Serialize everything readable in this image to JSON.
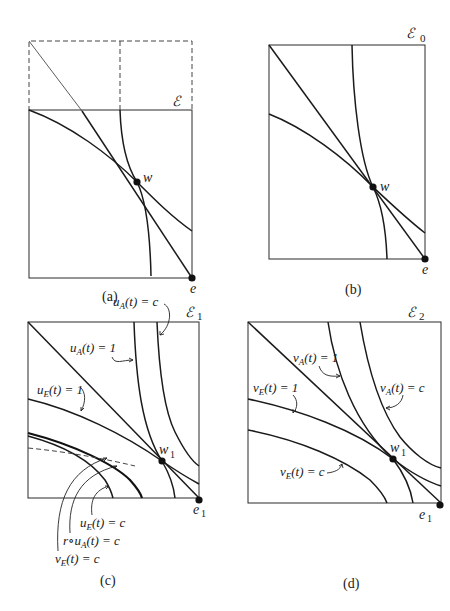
{
  "header": {
    "partial_text": ""
  },
  "panels": {
    "a": {
      "caption": "(a)",
      "set_label": "ℰ",
      "point_w": "w",
      "point_e": "e"
    },
    "b": {
      "caption": "(b)",
      "set_label": "ℰ",
      "set_sub": "0",
      "point_w": "w",
      "point_e": "e"
    },
    "c": {
      "caption": "(c)",
      "set_label": "ℰ",
      "set_sub": "1",
      "point_w": "w",
      "point_w_sub": "1",
      "point_e": "e",
      "point_e_sub": "1",
      "labels": {
        "uA_c": {
          "fn": "u",
          "sub": "A",
          "arg": "(t) = c"
        },
        "uA_1": {
          "fn": "u",
          "sub": "A",
          "arg": "(t) = 1"
        },
        "uE_1": {
          "fn": "u",
          "sub": "E",
          "arg": "(t) = 1"
        },
        "uE_c": {
          "fn": "u",
          "sub": "E",
          "arg": "(t) = c"
        },
        "r_uA_c": {
          "prefix": "r∘",
          "fn": "u",
          "sub": "A",
          "arg": "(t) = c"
        },
        "vE_c": {
          "fn": "v",
          "sub": "E",
          "arg": "(t) = c"
        }
      }
    },
    "d": {
      "caption": "(d)",
      "set_label": "ℰ",
      "set_sub": "2",
      "point_w": "w",
      "point_w_sub": "1",
      "point_e": "e",
      "point_e_sub": "1",
      "labels": {
        "vA_1": {
          "fn": "v",
          "sub": "A",
          "arg": "(t) = 1"
        },
        "vA_c": {
          "fn": "v",
          "sub": "A",
          "arg": "(t) = c"
        },
        "vE_1": {
          "fn": "v",
          "sub": "E",
          "arg": "(t) = 1"
        },
        "vE_c": {
          "fn": "v",
          "sub": "E",
          "arg": "(t) = c"
        }
      }
    }
  }
}
